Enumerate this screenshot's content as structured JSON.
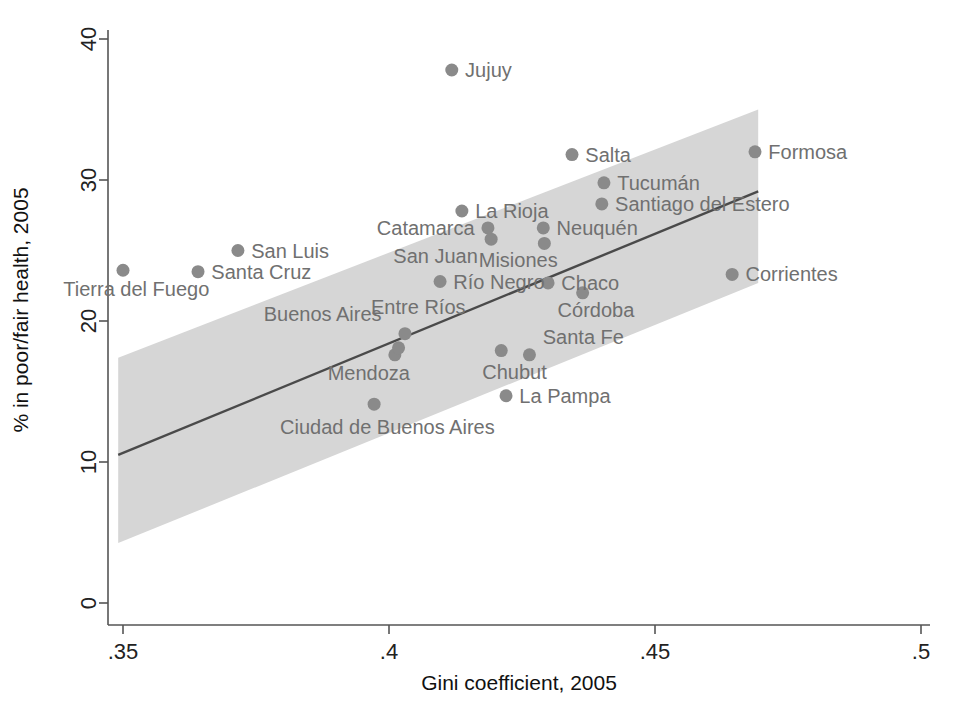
{
  "chart_data": {
    "type": "scatter",
    "title": "",
    "xlabel": "Gini coefficient, 2005",
    "ylabel": "% in poor/fair health, 2005",
    "xlim": [
      0.3456,
      0.5013
    ],
    "ylim": [
      -0.9,
      41.3
    ],
    "xticks": [
      0.35,
      0.4,
      0.45,
      0.5
    ],
    "xticklabels": [
      ".35",
      ".4",
      ".45",
      ".5"
    ],
    "yticks": [
      0,
      10,
      20,
      30,
      40
    ],
    "yticklabels": [
      "0",
      "10",
      "20",
      "30",
      "40"
    ],
    "grid": false,
    "legend": null,
    "marker_color": "#8a8a8a",
    "band_color": "#d6d6d6",
    "line_color": "#4a4a4a",
    "points": [
      {
        "name": "Jujuy",
        "x": 0.4118,
        "y": 37.8,
        "lx": 0.4143,
        "ly": 37.8,
        "anchor": "start"
      },
      {
        "name": "Formosa",
        "x": 0.4688,
        "y": 32.0,
        "lx": 0.4713,
        "ly": 32.0,
        "anchor": "start"
      },
      {
        "name": "Salta",
        "x": 0.4344,
        "y": 31.8,
        "lx": 0.4369,
        "ly": 31.8,
        "anchor": "start"
      },
      {
        "name": "Tucumán",
        "x": 0.4404,
        "y": 29.8,
        "lx": 0.4429,
        "ly": 29.8,
        "anchor": "start"
      },
      {
        "name": "Santiago del Estero",
        "x": 0.44,
        "y": 28.3,
        "lx": 0.4425,
        "ly": 28.3,
        "anchor": "start"
      },
      {
        "name": "La Rioja",
        "x": 0.4137,
        "y": 27.8,
        "lx": 0.4162,
        "ly": 27.8,
        "anchor": "start"
      },
      {
        "name": "Catamarca",
        "x": 0.4186,
        "y": 26.6,
        "lx": 0.4161,
        "ly": 26.6,
        "anchor": "end"
      },
      {
        "name": "Neuquén",
        "x": 0.429,
        "y": 26.6,
        "lx": 0.4315,
        "ly": 26.6,
        "anchor": "start"
      },
      {
        "name": "San Juan",
        "x": 0.4192,
        "y": 25.8,
        "lx": 0.4167,
        "ly": 24.6,
        "anchor": "end"
      },
      {
        "name": "Misiones",
        "x": 0.4292,
        "y": 25.5,
        "lx": 0.4317,
        "ly": 24.3,
        "anchor": "end"
      },
      {
        "name": "Tierra del Fuego",
        "x": 0.35,
        "y": 23.6,
        "lx": 0.3525,
        "ly": 22.3,
        "anchor": "middle"
      },
      {
        "name": "Corrientes",
        "x": 0.4645,
        "y": 23.3,
        "lx": 0.467,
        "ly": 23.3,
        "anchor": "start"
      },
      {
        "name": "Santa Cruz",
        "x": 0.3641,
        "y": 23.5,
        "lx": 0.3666,
        "ly": 23.5,
        "anchor": "start"
      },
      {
        "name": "San Luis",
        "x": 0.3716,
        "y": 25.0,
        "lx": 0.3741,
        "ly": 25.0,
        "anchor": "start"
      },
      {
        "name": "Río Negro",
        "x": 0.4096,
        "y": 22.8,
        "lx": 0.4121,
        "ly": 22.8,
        "anchor": "start"
      },
      {
        "name": "Chaco",
        "x": 0.4299,
        "y": 22.7,
        "lx": 0.4324,
        "ly": 22.7,
        "anchor": "start"
      },
      {
        "name": "Córdoba",
        "x": 0.4364,
        "y": 22.0,
        "lx": 0.4389,
        "ly": 20.8,
        "anchor": "middle"
      },
      {
        "name": "Entre Ríos",
        "x": 0.403,
        "y": 19.1,
        "lx": 0.4055,
        "ly": 21.0,
        "anchor": "middle"
      },
      {
        "name": "Buenos Aires",
        "x": 0.4011,
        "y": 17.6,
        "lx": 0.3986,
        "ly": 20.5,
        "anchor": "end"
      },
      {
        "name": "Mendoza",
        "x": 0.4018,
        "y": 18.1,
        "lx": 0.3962,
        "ly": 16.3,
        "anchor": "middle"
      },
      {
        "name": "Chubut",
        "x": 0.4211,
        "y": 17.9,
        "lx": 0.4236,
        "ly": 16.4,
        "anchor": "middle"
      },
      {
        "name": "Santa Fe",
        "x": 0.4264,
        "y": 17.6,
        "lx": 0.4289,
        "ly": 18.9,
        "anchor": "start"
      },
      {
        "name": "La Pampa",
        "x": 0.422,
        "y": 14.7,
        "lx": 0.4245,
        "ly": 14.7,
        "anchor": "start"
      },
      {
        "name": "Ciudad de Buenos Aires",
        "x": 0.3972,
        "y": 14.1,
        "lx": 0.3997,
        "ly": 12.5,
        "anchor": "middle"
      }
    ],
    "fit_line": {
      "x0": 0.3491,
      "y0": 10.5,
      "x1": 0.4694,
      "y1": 29.2
    },
    "ci_band": {
      "upper": [
        [
          0.3491,
          17.4
        ],
        [
          0.4694,
          35.0
        ]
      ],
      "lower": [
        [
          0.3491,
          4.25
        ],
        [
          0.4694,
          22.7
        ]
      ]
    }
  }
}
